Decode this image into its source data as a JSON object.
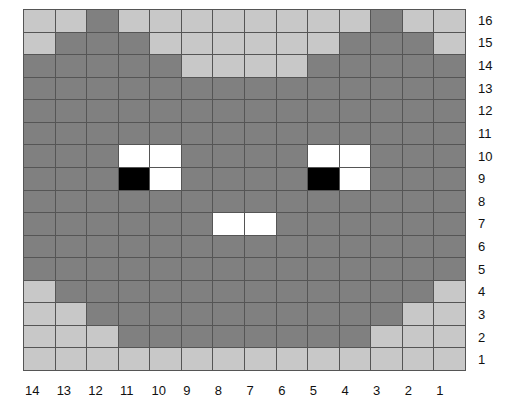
{
  "figure": {
    "type": "pixel-grid",
    "columns": 14,
    "rows": 16,
    "legend_colors": {
      "L": "#c8c8c8",
      "D": "#808080",
      "W": "#ffffff",
      "B": "#000000",
      "grid_line": "#555555"
    }
  },
  "column_labels": [
    "14",
    "13",
    "12",
    "11",
    "10",
    "9",
    "8",
    "7",
    "6",
    "5",
    "4",
    "3",
    "2",
    "1"
  ],
  "row_labels": [
    "16",
    "15",
    "14",
    "13",
    "12",
    "11",
    "10",
    "9",
    "8",
    "7",
    "6",
    "5",
    "4",
    "3",
    "2",
    "1"
  ],
  "grid_rows": [
    "LLDLLLLLLLLDLL",
    "LDDDLLLLLLDDDL",
    "DDDDDLLLLDDDDD",
    "DDDDDDDDDDDDDD",
    "DDDDDDDDDDDDDD",
    "DDDDDDDDDDDDDD",
    "DDDWWDDDDWWDDD",
    "DDDBWDDDDBWDDD",
    "DDDDDDDDDDDDDD",
    "DDDDDDWWDDDDDD",
    "DDDDDDDDDDDDDD",
    "DDDDDDDDDDDDDD",
    "LDDDDDDDDDDDDL",
    "LLDDDDDDDDDDLL",
    "LLLDDDDDDDDLLL",
    "LLLLLLLLLLLLLL"
  ]
}
